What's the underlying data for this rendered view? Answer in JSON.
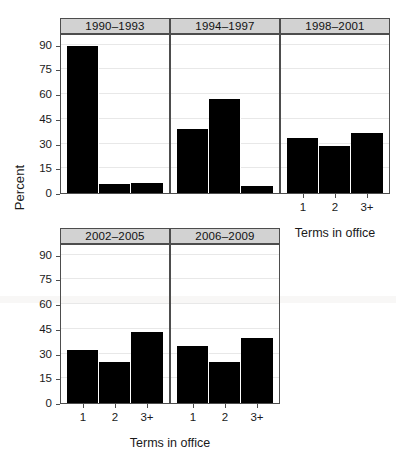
{
  "chart_data": {
    "type": "bar",
    "title": "",
    "xlabel": "Terms in office",
    "ylabel": "Percent",
    "categories": [
      "1",
      "2",
      "3+"
    ],
    "ylim": [
      0,
      97
    ],
    "yticks": [
      0,
      15,
      30,
      45,
      60,
      75,
      90
    ],
    "ytick_labels": [
      "0",
      "15",
      "30",
      "45",
      "60",
      "75",
      "90"
    ],
    "grid": true,
    "legend": false,
    "facet_layout": {
      "rows": 2,
      "cols": 3
    },
    "panels": [
      {
        "label": "1990–1993",
        "values": [
          89,
          5.5,
          6
        ]
      },
      {
        "label": "1994–1997",
        "values": [
          39,
          57,
          4
        ]
      },
      {
        "label": "1998–2001",
        "values": [
          33.5,
          28.5,
          36.5
        ]
      },
      {
        "label": "2002–2005",
        "values": [
          32,
          25,
          43
        ]
      },
      {
        "label": "2006–2009",
        "values": [
          34.5,
          25,
          39.5
        ]
      }
    ]
  },
  "axis": {
    "y_title": "Percent",
    "x_title_right": "Terms in office",
    "x_title_bottom": "Terms in office"
  },
  "colors": {
    "bar": "#000000",
    "strip_background": "#d2d2d2",
    "panel_border": "#4d4d4d",
    "gridline": "#e8e8e8",
    "background": "#ffffff"
  },
  "caption_fragment": ""
}
